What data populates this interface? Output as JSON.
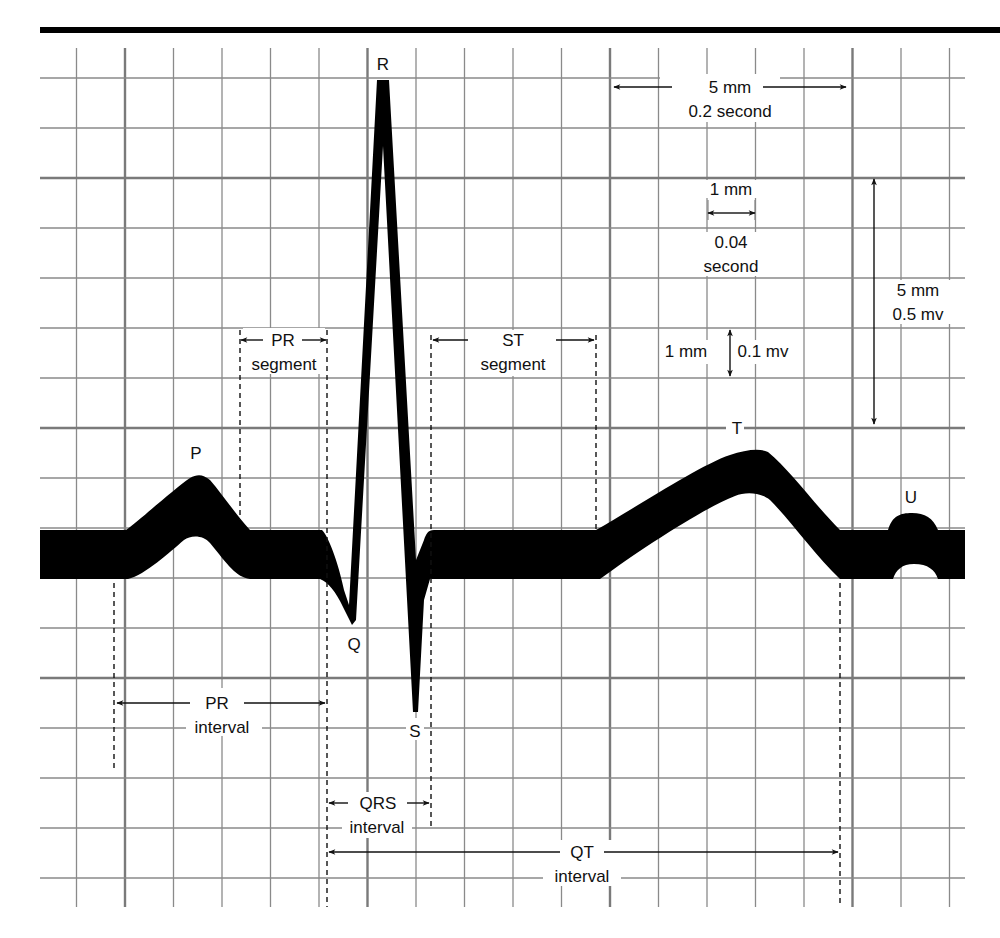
{
  "figure": {
    "colors": {
      "background": "#ffffff",
      "grid_minor": "#8a8a8a",
      "grid_major": "#7a7a7a",
      "trace": "#000000",
      "text": "#111111"
    },
    "grid": {
      "left": 40,
      "right": 965,
      "top": 48,
      "bottom": 907,
      "minor_spacing_x": 48.5,
      "minor_spacing_y": 50,
      "major_every": 5
    }
  },
  "waves": {
    "P": "P",
    "Q": "Q",
    "R": "R",
    "S": "S",
    "T": "T",
    "U": "U"
  },
  "scale_annotations": {
    "horizontal_5mm": {
      "line1": "5 mm",
      "line2": "0.2 second"
    },
    "horizontal_1mm": {
      "line1": "1 mm",
      "line2": "0.04",
      "line3": "second"
    },
    "vertical_1mm": {
      "left": "1 mm",
      "right": "0.1 mv"
    },
    "vertical_5mm": {
      "line1": "5 mm",
      "line2": "0.5 mv"
    }
  },
  "intervals": {
    "pr_segment": {
      "line1": "PR",
      "line2": "segment"
    },
    "st_segment": {
      "line1": "ST",
      "line2": "segment"
    },
    "pr_interval": {
      "line1": "PR",
      "line2": "interval"
    },
    "qrs_interval": {
      "line1": "QRS",
      "line2": "interval"
    },
    "qt_interval": {
      "line1": "QT",
      "line2": "interval"
    }
  }
}
